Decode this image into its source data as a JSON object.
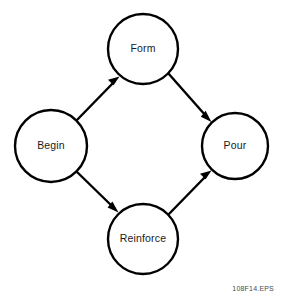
{
  "diagram": {
    "background_color": "#ffffff",
    "stroke_color": "#000000",
    "text_color": "#1a1a1a",
    "nodes": [
      {
        "id": "begin",
        "label": "Begin",
        "cx": 51,
        "cy": 146,
        "r": 36
      },
      {
        "id": "form",
        "label": "Form",
        "cx": 143,
        "cy": 49,
        "r": 35
      },
      {
        "id": "reinforce",
        "label": "Reinforce",
        "cx": 143,
        "cy": 239,
        "r": 35
      },
      {
        "id": "pour",
        "label": "Pour",
        "cx": 235,
        "cy": 146,
        "r": 33
      }
    ],
    "edges": [
      {
        "id": "begin-to-form",
        "from": "begin",
        "to": "form",
        "direction": "up-right",
        "arrowhead": "end"
      },
      {
        "id": "form-to-pour",
        "from": "form",
        "to": "pour",
        "direction": "down-right",
        "arrowhead": "end"
      },
      {
        "id": "begin-to-reinforce",
        "from": "begin",
        "to": "reinforce",
        "direction": "down-right",
        "arrowhead": "end"
      },
      {
        "id": "reinforce-to-pour",
        "from": "reinforce",
        "to": "pour",
        "direction": "up-right",
        "arrowhead": "end"
      }
    ]
  },
  "caption": {
    "text": "108F14.EPS"
  }
}
